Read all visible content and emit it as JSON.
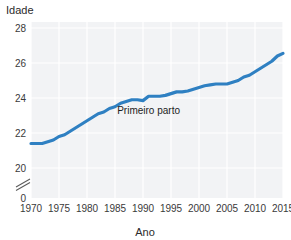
{
  "chart_data": {
    "type": "line",
    "title": "",
    "xlabel": "Ano",
    "ylabel": "Idade",
    "xlim": [
      1970,
      2015
    ],
    "ylim": [
      19.3,
      28
    ],
    "grid": true,
    "legend_position": "none",
    "y_axis_break": true,
    "y_axis_break_symbol": "//",
    "xticks": [
      1970,
      1975,
      1980,
      1985,
      1990,
      1995,
      2000,
      2005,
      2010,
      2015
    ],
    "xticklabels": [
      "1970",
      "1975",
      "1980",
      "1985",
      "1990",
      "1995",
      "2000",
      "2005",
      "2010",
      "2015"
    ],
    "yticks": [
      0,
      20,
      22,
      24,
      26,
      28
    ],
    "yticklabels": [
      "0",
      "20",
      "22",
      "24",
      "26",
      "28"
    ],
    "annotations": [
      {
        "text": "Primeiro parto",
        "x": 1991,
        "y": 23.1
      }
    ],
    "series": [
      {
        "name": "Primeiro parto",
        "color": "#2f80c2",
        "x": [
          1970,
          1971,
          1972,
          1973,
          1974,
          1975,
          1976,
          1977,
          1978,
          1979,
          1980,
          1981,
          1982,
          1983,
          1984,
          1985,
          1986,
          1987,
          1988,
          1989,
          1990,
          1991,
          1992,
          1993,
          1994,
          1995,
          1996,
          1997,
          1998,
          1999,
          2000,
          2001,
          2002,
          2003,
          2004,
          2005,
          2006,
          2007,
          2008,
          2009,
          2010,
          2011,
          2012,
          2013,
          2014,
          2015
        ],
        "values": [
          21.4,
          21.4,
          21.4,
          21.5,
          21.6,
          21.8,
          21.9,
          22.1,
          22.3,
          22.5,
          22.7,
          22.9,
          23.1,
          23.2,
          23.4,
          23.5,
          23.7,
          23.8,
          23.9,
          23.9,
          23.85,
          24.1,
          24.1,
          24.1,
          24.15,
          24.25,
          24.35,
          24.35,
          24.4,
          24.5,
          24.6,
          24.7,
          24.75,
          24.8,
          24.8,
          24.8,
          24.9,
          25.0,
          25.2,
          25.3,
          25.5,
          25.7,
          25.9,
          26.1,
          26.4,
          26.55
        ]
      }
    ],
    "colors": {
      "line": "#2f80c2",
      "plot_background": "#f2f3f5",
      "gridline": "#ffffff",
      "text": "#2b2b2b",
      "axis": "#b9bcc0"
    }
  }
}
